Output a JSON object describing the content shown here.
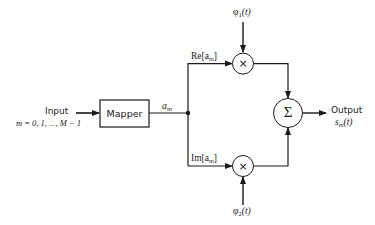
{
  "diagram": {
    "type": "block-diagram",
    "input": {
      "label": "Input",
      "sublabel": "m = 0, 1, ..., M − 1"
    },
    "mapper": {
      "label": "Mapper"
    },
    "mapper_output": {
      "symbol": "a",
      "subscript": "m"
    },
    "upper_branch": {
      "label_prefix": "Re[a",
      "label_subscript": "m",
      "label_suffix": "]",
      "basis": {
        "symbol": "φ",
        "subscript": "1",
        "suffix": "(t)"
      },
      "operator": "×"
    },
    "lower_branch": {
      "label_prefix": "Im[a",
      "label_subscript": "m",
      "label_suffix": "]",
      "basis": {
        "symbol": "φ",
        "subscript": "2",
        "suffix": "(t)"
      },
      "operator": "×"
    },
    "summer": {
      "operator": "Σ"
    },
    "output": {
      "label": "Output",
      "symbol": "s",
      "subscript": "m",
      "suffix": "(t)"
    },
    "colors": {
      "line": "#1a1a1a",
      "background": "#ffffff"
    }
  }
}
